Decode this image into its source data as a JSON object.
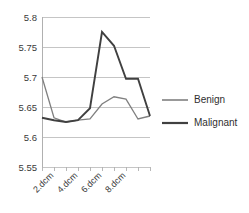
{
  "chart_data": {
    "type": "line",
    "title": "",
    "xlabel": "",
    "ylabel": "",
    "ylim": [
      5.55,
      5.8
    ],
    "yticks": [
      "5.55",
      "5.6",
      "5.65",
      "5.7",
      "5.75",
      "5.8"
    ],
    "ytick_values": [
      5.55,
      5.6,
      5.65,
      5.7,
      5.75,
      5.8
    ],
    "grid": true,
    "legend_position": "right",
    "x": [
      1,
      2,
      3,
      4,
      5,
      6,
      7,
      8,
      9,
      10
    ],
    "categories": [
      "",
      "2.dcm",
      "",
      "4.dcm",
      "",
      "6.dcm",
      "",
      "8.dcm",
      "",
      ""
    ],
    "xtick_labels": [
      "2.dcm",
      "4.dcm",
      "6.dcm",
      "8.dcm"
    ],
    "xtick_label_positions": [
      2,
      4,
      6,
      8
    ],
    "series": [
      {
        "name": "Benign",
        "color": "#808080",
        "values": [
          5.7,
          5.632,
          5.625,
          5.628,
          5.63,
          5.655,
          5.667,
          5.663,
          5.63,
          5.635
        ]
      },
      {
        "name": "Malignant",
        "color": "#404040",
        "values": [
          5.632,
          5.628,
          5.625,
          5.628,
          5.648,
          5.775,
          5.752,
          5.697,
          5.697,
          5.635
        ]
      }
    ]
  },
  "axis": {
    "y_labels": [
      "5.8",
      "5.75",
      "5.7",
      "5.65",
      "5.6",
      "5.55"
    ],
    "x_labels": [
      "2.dcm",
      "4.dcm",
      "6.dcm",
      "8.dcm"
    ]
  },
  "legend": {
    "items": [
      {
        "label": "Benign",
        "color": "#808080"
      },
      {
        "label": "Malignant",
        "color": "#404040"
      }
    ]
  },
  "colors": {
    "benign": "#808080",
    "malignant": "#404040",
    "gridline": "#bfbfbf",
    "axis": "#b0b0b0",
    "text": "#3a3a3a",
    "background": "#ffffff"
  }
}
